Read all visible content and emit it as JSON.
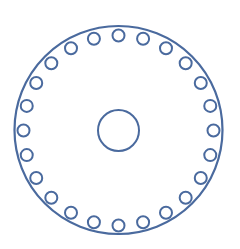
{
  "diagram": {
    "stroke_color": "#4a6a9e",
    "background": "#ffffff",
    "outer_circle": {
      "cx": 118.5,
      "cy": 130,
      "r": 104
    },
    "center_circle": {
      "cx": 118.5,
      "cy": 130.5,
      "r": 20.5
    },
    "bolt_circle": {
      "cx": 118.5,
      "cy": 130.5,
      "ring_radius": 95,
      "hole_radius": 6,
      "hole_count": 24
    }
  }
}
